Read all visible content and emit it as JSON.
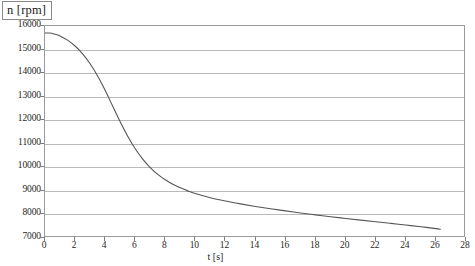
{
  "chart_data": {
    "type": "line",
    "title": "",
    "xlabel": "t [s]",
    "ylabel": "n [rpm]",
    "xlim": [
      0,
      28
    ],
    "ylim": [
      7000,
      16000
    ],
    "xticks": [
      0,
      2,
      4,
      6,
      8,
      10,
      12,
      14,
      16,
      18,
      20,
      22,
      24,
      26,
      28
    ],
    "yticks": [
      7000,
      8000,
      9000,
      10000,
      11000,
      12000,
      13000,
      14000,
      15000,
      16000
    ],
    "xtick_labels": [
      "0",
      "2",
      "4",
      "6",
      "8",
      "10",
      "12",
      "14",
      "16",
      "18",
      "20",
      "22",
      "24",
      "26",
      "28"
    ],
    "ytick_labels": [
      "7000",
      "8000",
      "9000",
      "10000",
      "11000",
      "12000",
      "13000",
      "14000",
      "15000",
      "16000"
    ],
    "grid": "horizontal",
    "legend": "none",
    "line_color": "#555555",
    "grid_color": "#b9b9b9",
    "frame_color": "#9a9a9a",
    "series": [
      {
        "name": "n(t)",
        "x": [
          0.0,
          0.3,
          0.6,
          1.0,
          1.5,
          2.0,
          2.5,
          3.0,
          3.5,
          4.0,
          4.5,
          5.0,
          5.5,
          6.0,
          6.5,
          7.0,
          7.5,
          8.0,
          8.5,
          9.0,
          9.5,
          10.0,
          11.0,
          12.0,
          13.0,
          14.0,
          15.0,
          16.0,
          17.0,
          18.0,
          19.0,
          20.0,
          21.0,
          22.0,
          23.0,
          24.0,
          25.0,
          26.0,
          26.3
        ],
        "y": [
          15700,
          15700,
          15660,
          15580,
          15400,
          15150,
          14820,
          14400,
          13880,
          13270,
          12600,
          11930,
          11320,
          10790,
          10350,
          9990,
          9700,
          9470,
          9280,
          9130,
          9000,
          8890,
          8710,
          8570,
          8450,
          8340,
          8240,
          8150,
          8060,
          7980,
          7900,
          7830,
          7760,
          7690,
          7620,
          7550,
          7480,
          7400,
          7370
        ]
      }
    ]
  },
  "axis": {
    "y_title": "n [rpm]",
    "x_title": "t [s]"
  }
}
